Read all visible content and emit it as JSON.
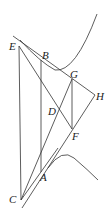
{
  "diagram": {
    "type": "geometric-construction",
    "points": [
      "E",
      "B",
      "G",
      "H",
      "D",
      "F",
      "A",
      "C"
    ],
    "labels": {
      "E": "E",
      "B": "B",
      "G": "G",
      "H": "H",
      "D": "D",
      "F": "F",
      "A": "A",
      "C": "C"
    },
    "segments": [
      [
        "E",
        "C"
      ],
      [
        "B",
        "A"
      ],
      [
        "G",
        "F"
      ],
      [
        "E",
        "F"
      ],
      [
        "C",
        "G"
      ],
      [
        "B",
        "H"
      ],
      [
        "A",
        "H"
      ]
    ],
    "curves": [
      "upper-hyperbola-branch",
      "lower-hyperbola-branch"
    ]
  }
}
